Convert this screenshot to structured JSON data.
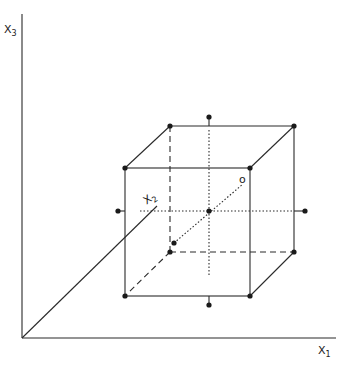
{
  "diagram": {
    "type": "3d-coordinate-cube",
    "axes": {
      "x1": {
        "label": "X",
        "subscript": "1"
      },
      "x2": {
        "label": "X",
        "subscript": "2"
      },
      "x3": {
        "label": "X",
        "subscript": "3"
      }
    },
    "center_label": "o",
    "colors": {
      "line": "#2a2a2a",
      "background": "#ffffff"
    }
  }
}
